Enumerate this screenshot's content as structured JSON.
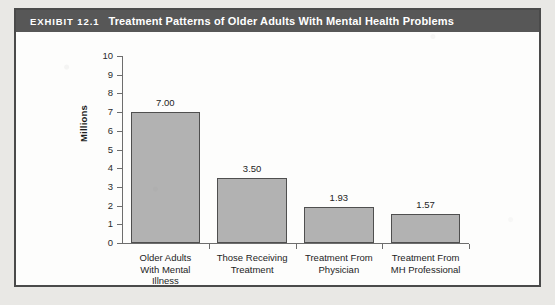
{
  "exhibit": {
    "tag": "EXHIBIT 12.1",
    "title": "Treatment Patterns of Older Adults With Mental Health Problems"
  },
  "colors": {
    "titlebar_bg": "#575757",
    "titlebar_text": "#ffffff",
    "frame_border": "#4a4a4a",
    "bar_fill": "#b2b2b2",
    "bar_border": "#4f4f4f",
    "axis": "#6d6d6d",
    "page_bg": "#e9e8e5"
  },
  "chart_data": {
    "type": "bar",
    "title": "Treatment Patterns of Older Adults With Mental Health Problems",
    "xlabel": "",
    "ylabel": "Millions",
    "ylim": [
      0,
      10
    ],
    "ytick_step": 1,
    "ytick_labels": [
      "10",
      "9",
      "8",
      "7",
      "6",
      "5",
      "4",
      "3",
      "2",
      "1",
      "0"
    ],
    "grid": false,
    "legend": false,
    "categories": [
      "Older Adults\nWith Mental\nIllness",
      "Those Receiving\nTreatment",
      "Treatment From\nPhysician",
      "Treatment From\nMH Professional"
    ],
    "values": [
      7.0,
      3.5,
      1.93,
      1.57
    ],
    "value_labels": [
      "7.00",
      "3.50",
      "1.93",
      "1.57"
    ]
  }
}
